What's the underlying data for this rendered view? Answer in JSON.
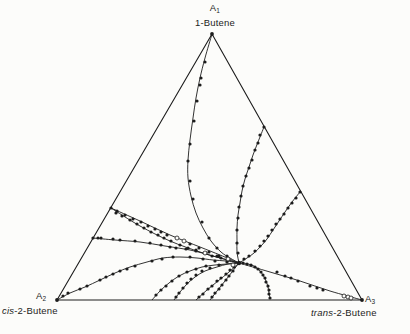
{
  "page": {
    "background": "#fcfcfa",
    "ink": "#1c1c1c"
  },
  "labels": {
    "top": {
      "base": "A",
      "sub": "1",
      "italic": "",
      "rest": "1-Butene"
    },
    "left": {
      "base": "A",
      "sub": "2",
      "italic": "cis",
      "rest": "-2-Butene"
    },
    "right": {
      "base": "A",
      "sub": "3",
      "italic": "trans",
      "rest": "-2-Butene"
    }
  },
  "chart_data": {
    "type": "scatter",
    "subtype": "ternary-reaction-path-diagram",
    "title": "",
    "coordinate_system": "pixel coordinates of the 410x334 canvas",
    "grid": "off",
    "legend": "none",
    "vertices": [
      {
        "id": "A1",
        "species": "1-Butene",
        "px": [
          212,
          34
        ]
      },
      {
        "id": "A2",
        "species": "cis-2-Butene",
        "px": [
          57,
          300
        ]
      },
      {
        "id": "A3",
        "species": "trans-2-Butene",
        "px": [
          362,
          300
        ]
      }
    ],
    "equilibrium_px": [
      239,
      263
    ],
    "equilibrium_composition_estimate": {
      "1-butene": 0.14,
      "cis-2-butene": 0.35,
      "trans-2-butene": 0.51
    },
    "style": {
      "edge_width": 1.1,
      "path_width": 0.9,
      "filled_r": 1.6,
      "open_r": 2.0
    },
    "trajectories": [
      {
        "id": "from-A1-apex",
        "curve": [
          [
            212,
            34
          ],
          [
            205,
            58
          ],
          [
            200,
            78
          ],
          [
            196,
            98
          ],
          [
            193,
            118
          ],
          [
            190,
            140
          ],
          [
            188,
            160
          ],
          [
            188,
            178
          ],
          [
            191,
            196
          ],
          [
            196,
            213
          ],
          [
            203,
            228
          ],
          [
            211,
            241
          ],
          [
            221,
            252
          ],
          [
            230,
            258
          ],
          [
            239,
            263
          ]
        ],
        "filled": [
          [
            205,
            62
          ],
          [
            201,
            78
          ],
          [
            200,
            85
          ],
          [
            197,
            101
          ],
          [
            194,
            121
          ],
          [
            190,
            144
          ],
          [
            188,
            161
          ],
          [
            190,
            181
          ],
          [
            193,
            199
          ],
          [
            202,
            222
          ],
          [
            209,
            238
          ],
          [
            217,
            248
          ],
          [
            227,
            256
          ]
        ],
        "open": []
      },
      {
        "id": "from-right-edge-upper",
        "curve": [
          [
            264,
            127
          ],
          [
            258,
            142
          ],
          [
            253,
            155
          ],
          [
            249,
            167
          ],
          [
            245,
            179
          ],
          [
            242,
            191
          ],
          [
            240,
            203
          ],
          [
            238,
            215
          ],
          [
            237,
            228
          ],
          [
            237,
            241
          ],
          [
            237,
            252
          ],
          [
            239,
            263
          ]
        ],
        "filled": [
          [
            264,
            127
          ],
          [
            260,
            135
          ],
          [
            258,
            143
          ],
          [
            255,
            150
          ],
          [
            252,
            160
          ],
          [
            249,
            168
          ],
          [
            246,
            176
          ],
          [
            243,
            186
          ],
          [
            241,
            196
          ],
          [
            239,
            207
          ],
          [
            238,
            218
          ],
          [
            237,
            230
          ],
          [
            237,
            243
          ],
          [
            238,
            253
          ]
        ],
        "open": []
      },
      {
        "id": "from-right-edge-lower",
        "curve": [
          [
            300,
            192
          ],
          [
            292,
            202
          ],
          [
            285,
            212
          ],
          [
            279,
            221
          ],
          [
            273,
            230
          ],
          [
            267,
            239
          ],
          [
            261,
            246
          ],
          [
            254,
            253
          ],
          [
            247,
            258
          ],
          [
            239,
            263
          ]
        ],
        "filled": [
          [
            300,
            192
          ],
          [
            296,
            198
          ],
          [
            292,
            203
          ],
          [
            288,
            208
          ],
          [
            284,
            214
          ],
          [
            280,
            219
          ],
          [
            276,
            224
          ],
          [
            272,
            230
          ],
          [
            268,
            236
          ],
          [
            264,
            241
          ],
          [
            260,
            246
          ],
          [
            255,
            251
          ],
          [
            249,
            256
          ],
          [
            244,
            259
          ]
        ],
        "open": []
      },
      {
        "id": "from-A3",
        "curve": [
          [
            362,
            300
          ],
          [
            330,
            291
          ],
          [
            300,
            281
          ],
          [
            270,
            272
          ],
          [
            239,
            263
          ]
        ],
        "filled": [
          [
            277,
            272
          ],
          [
            285,
            276
          ],
          [
            291,
            278
          ],
          [
            298,
            281
          ],
          [
            310,
            286
          ],
          [
            317,
            288
          ],
          [
            323,
            290
          ]
        ],
        "open": [
          [
            344,
            296
          ],
          [
            348,
            297
          ],
          [
            351,
            298
          ]
        ]
      },
      {
        "id": "from-base-dense",
        "curve": [
          [
            270,
            299
          ],
          [
            269,
            293
          ],
          [
            268,
            287
          ],
          [
            266,
            281
          ],
          [
            263,
            275
          ],
          [
            259,
            270
          ],
          [
            254,
            266
          ],
          [
            248,
            264
          ],
          [
            243,
            263
          ],
          [
            239,
            263
          ]
        ],
        "filled": [
          [
            270,
            298
          ],
          [
            269,
            294
          ],
          [
            269,
            290
          ],
          [
            268,
            286
          ],
          [
            266,
            282
          ],
          [
            265,
            278
          ],
          [
            263,
            275
          ],
          [
            261,
            272
          ],
          [
            258,
            269
          ],
          [
            255,
            267
          ],
          [
            251,
            265
          ],
          [
            247,
            264
          ],
          [
            243,
            263
          ]
        ],
        "open": []
      },
      {
        "id": "from-base-pair-left",
        "curve": [
          [
            196,
            300
          ],
          [
            207,
            290
          ],
          [
            218,
            281
          ],
          [
            229,
            272
          ],
          [
            239,
            263
          ]
        ],
        "filled": [
          [
            199,
            297
          ],
          [
            203,
            294
          ],
          [
            208,
            289
          ],
          [
            212,
            286
          ],
          [
            217,
            281
          ],
          [
            221,
            278
          ],
          [
            226,
            274
          ],
          [
            230,
            270
          ],
          [
            234,
            267
          ]
        ],
        "open": []
      },
      {
        "id": "from-base-pair-right",
        "curve": [
          [
            210,
            300
          ],
          [
            217,
            291
          ],
          [
            225,
            281
          ],
          [
            232,
            272
          ],
          [
            239,
            263
          ]
        ],
        "filled": [
          [
            212,
            297
          ],
          [
            215,
            293
          ],
          [
            219,
            289
          ],
          [
            222,
            285
          ],
          [
            226,
            280
          ],
          [
            229,
            276
          ],
          [
            233,
            271
          ]
        ],
        "open": []
      },
      {
        "id": "from-base-steep-a",
        "curve": [
          [
            174,
            300
          ],
          [
            180,
            292
          ],
          [
            187,
            284
          ],
          [
            195,
            277
          ],
          [
            205,
            271
          ],
          [
            217,
            267
          ],
          [
            228,
            264
          ],
          [
            239,
            263
          ]
        ],
        "filled": [
          [
            176,
            297
          ],
          [
            179,
            293
          ],
          [
            183,
            288
          ],
          [
            187,
            283
          ],
          [
            191,
            279
          ],
          [
            196,
            275
          ],
          [
            202,
            271
          ],
          [
            210,
            268
          ],
          [
            219,
            265
          ]
        ],
        "open": []
      },
      {
        "id": "from-base-steep-b",
        "curve": [
          [
            152,
            300
          ],
          [
            160,
            291
          ],
          [
            169,
            283
          ],
          [
            179,
            276
          ],
          [
            190,
            271
          ],
          [
            202,
            267
          ],
          [
            215,
            265
          ],
          [
            227,
            264
          ],
          [
            239,
            263
          ]
        ],
        "filled": [
          [
            156,
            295
          ],
          [
            161,
            290
          ],
          [
            166,
            286
          ],
          [
            172,
            281
          ],
          [
            179,
            276
          ],
          [
            187,
            272
          ],
          [
            196,
            269
          ],
          [
            206,
            266
          ]
        ],
        "open": []
      },
      {
        "id": "from-A2-curved",
        "curve": [
          [
            57,
            300
          ],
          [
            70,
            293
          ],
          [
            85,
            287
          ],
          [
            100,
            280
          ],
          [
            115,
            273
          ],
          [
            130,
            267
          ],
          [
            147,
            262
          ],
          [
            163,
            258
          ],
          [
            180,
            257
          ],
          [
            197,
            258
          ],
          [
            213,
            260
          ],
          [
            226,
            261
          ],
          [
            239,
            263
          ]
        ],
        "filled": [
          [
            63,
            296
          ],
          [
            68,
            293
          ],
          [
            80,
            289
          ],
          [
            87,
            286
          ],
          [
            100,
            280
          ],
          [
            106,
            277
          ],
          [
            113,
            274
          ],
          [
            120,
            271
          ],
          [
            127,
            269
          ],
          [
            135,
            266
          ],
          [
            152,
            261
          ],
          [
            162,
            259
          ],
          [
            173,
            257
          ],
          [
            190,
            257
          ],
          [
            203,
            259
          ],
          [
            215,
            261
          ],
          [
            227,
            262
          ]
        ],
        "open": []
      },
      {
        "id": "from-left-edge-pair-upper",
        "curve": [
          [
            111,
            208
          ],
          [
            140,
            221
          ],
          [
            170,
            235
          ],
          [
            200,
            247
          ],
          [
            220,
            255
          ],
          [
            239,
            263
          ]
        ],
        "filled": [
          [
            111,
            208
          ],
          [
            117,
            211
          ],
          [
            125,
            215
          ],
          [
            133,
            219
          ],
          [
            141,
            222
          ],
          [
            148,
            226
          ],
          [
            155,
            229
          ],
          [
            161,
            232
          ],
          [
            167,
            235
          ],
          [
            190,
            244
          ],
          [
            199,
            248
          ],
          [
            209,
            252
          ],
          [
            219,
            256
          ],
          [
            228,
            259
          ]
        ],
        "open": [
          [
            177,
            238
          ],
          [
            184,
            241
          ]
        ]
      },
      {
        "id": "from-left-edge-pair-lower",
        "curve": [
          [
            111,
            208
          ],
          [
            140,
            226
          ],
          [
            170,
            241
          ],
          [
            200,
            252
          ],
          [
            220,
            258
          ],
          [
            239,
            263
          ]
        ],
        "filled": [
          [
            116,
            213
          ],
          [
            122,
            216
          ],
          [
            130,
            220
          ],
          [
            137,
            224
          ],
          [
            144,
            228
          ],
          [
            151,
            232
          ],
          [
            158,
            235
          ],
          [
            164,
            238
          ],
          [
            171,
            241
          ],
          [
            180,
            245
          ],
          [
            188,
            248
          ],
          [
            196,
            250
          ],
          [
            212,
            256
          ],
          [
            221,
            258
          ]
        ],
        "open": [
          [
            205,
            253
          ]
        ]
      },
      {
        "id": "from-left-edge-low",
        "curve": [
          [
            93,
            238
          ],
          [
            115,
            240
          ],
          [
            140,
            242
          ],
          [
            165,
            246
          ],
          [
            190,
            250
          ],
          [
            213,
            256
          ],
          [
            239,
            263
          ]
        ],
        "filled": [
          [
            93,
            238
          ],
          [
            98,
            238
          ],
          [
            101,
            238
          ],
          [
            113,
            239
          ],
          [
            120,
            240
          ],
          [
            135,
            241
          ],
          [
            150,
            243
          ],
          [
            161,
            245
          ],
          [
            170,
            247
          ],
          [
            176,
            248
          ],
          [
            186,
            249
          ],
          [
            196,
            251
          ],
          [
            206,
            253
          ],
          [
            217,
            256
          ],
          [
            227,
            260
          ]
        ],
        "open": []
      }
    ],
    "extra_open_points": [
      [
        228,
        259
      ],
      [
        233,
        265
      ]
    ],
    "vertex_dot_r": 1.9
  }
}
